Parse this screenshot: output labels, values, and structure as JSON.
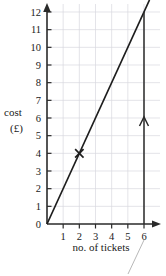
{
  "chart_data": {
    "type": "line",
    "title": "",
    "xlabel": "no. of tickets",
    "ylabel_line1": "cost",
    "ylabel_line2": "(£)",
    "x": [
      0,
      6
    ],
    "values": [
      0,
      12
    ],
    "x_ticks": [
      "0",
      "1",
      "2",
      "3",
      "4",
      "5",
      "6"
    ],
    "x_tick_values": [
      0,
      1,
      2,
      3,
      4,
      5,
      6
    ],
    "y_ticks": [
      "0",
      "1",
      "2",
      "3",
      "4",
      "5",
      "6",
      "7",
      "8",
      "9",
      "10",
      "11",
      "12"
    ],
    "y_tick_values": [
      0,
      1,
      2,
      3,
      4,
      5,
      6,
      7,
      8,
      9,
      10,
      11,
      12
    ],
    "xlim": [
      0,
      6
    ],
    "ylim": [
      0,
      12
    ],
    "grid": true,
    "legend": "none",
    "slope": 2,
    "intercept": 0,
    "series": [
      {
        "name": "cost per tickets",
        "points": [
          [
            0,
            0
          ],
          [
            6,
            12
          ]
        ]
      }
    ],
    "markers": [
      {
        "label": "cross-marker",
        "symbol": "x",
        "x": 2,
        "y": 4
      }
    ],
    "annotations": [
      {
        "label": "vertical-arrow-at-6",
        "x": 6,
        "y_start": 0,
        "y_end": 12,
        "arrow_at_y": 6,
        "direction": "up"
      },
      {
        "label": "leader-line",
        "description": "faint diagonal leader below axis"
      }
    ],
    "colors": {
      "line": "#1d1d1d",
      "axis": "#2a2a2a",
      "grid": "#d8d8e0",
      "leader": "#b8b8b8",
      "background": "#ffffff"
    }
  }
}
